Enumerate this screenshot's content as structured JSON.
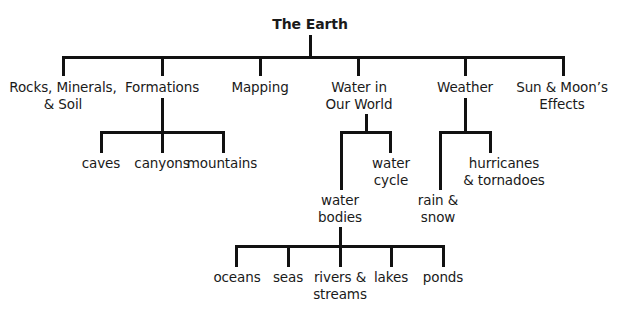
{
  "diagram": {
    "title": "The Earth",
    "root": {
      "label": "The Earth"
    },
    "level1": [
      {
        "id": "rocks",
        "lines": [
          "Rocks, Minerals,",
          "& Soil"
        ]
      },
      {
        "id": "formations",
        "lines": [
          "Formations"
        ]
      },
      {
        "id": "mapping",
        "lines": [
          "Mapping"
        ]
      },
      {
        "id": "water",
        "lines": [
          "Water in",
          "Our World"
        ]
      },
      {
        "id": "weather",
        "lines": [
          "Weather"
        ]
      },
      {
        "id": "sun-moon",
        "lines": [
          "Sun & Moon’s",
          "Effects"
        ]
      }
    ],
    "formations_children": [
      {
        "lines": [
          "caves"
        ]
      },
      {
        "lines": [
          "canyons"
        ]
      },
      {
        "lines": [
          "mountains"
        ]
      }
    ],
    "water_children": [
      {
        "lines": [
          "water",
          "bodies"
        ]
      },
      {
        "lines": [
          "water",
          "cycle"
        ]
      }
    ],
    "weather_children": [
      {
        "lines": [
          "rain &",
          "snow"
        ]
      },
      {
        "lines": [
          "hurricanes",
          "& tornadoes"
        ]
      }
    ],
    "water_bodies_children": [
      {
        "lines": [
          "oceans"
        ]
      },
      {
        "lines": [
          "seas"
        ]
      },
      {
        "lines": [
          "rivers &",
          "streams"
        ]
      },
      {
        "lines": [
          "lakes"
        ]
      },
      {
        "lines": [
          "ponds"
        ]
      }
    ],
    "line_color": "#111111"
  }
}
